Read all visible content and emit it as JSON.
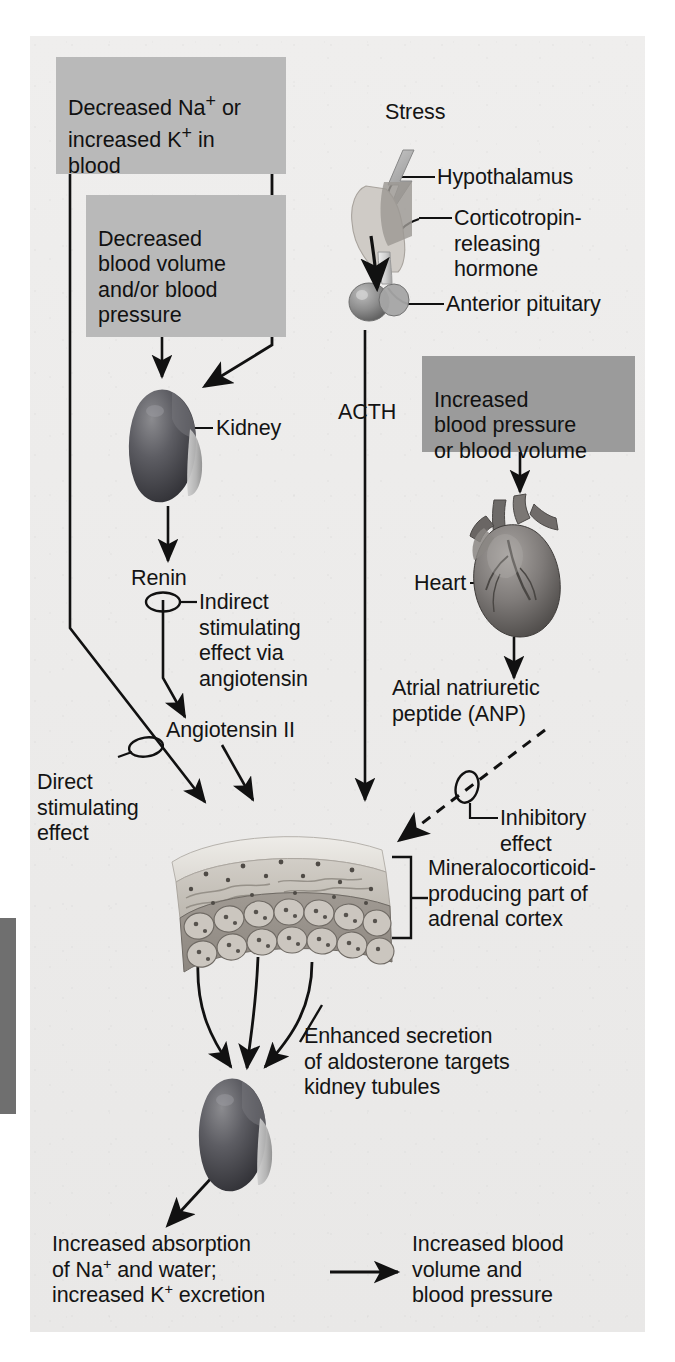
{
  "figure": {
    "type": "physiology-flow-diagram",
    "plate_color": "#edeceb",
    "box_color_light": "#b9b9b9",
    "box_color_dark": "#9b9b9b",
    "line_color": "#111111"
  },
  "boxes": [
    {
      "id": "box-sodium-potassium",
      "name": "decreased-sodium-increased-potassium-box",
      "text": "Decreased Na+ or\nincreased K+ in\nblood",
      "shade": "light"
    },
    {
      "id": "box-blood-volume",
      "name": "decreased-blood-volume-box",
      "text": "Decreased\nblood volume\nand/or blood\npressure",
      "shade": "light"
    },
    {
      "id": "box-increased-bp",
      "name": "increased-blood-pressure-box",
      "text": "Increased\nblood pressure\nor blood volume",
      "shade": "dark"
    }
  ],
  "labels": {
    "stress": "Stress",
    "hypothalamus": "Hypothalamus",
    "crh": "Corticotropin-\nreleasing\nhormone",
    "anterior_pituitary": "Anterior pituitary",
    "acth": "ACTH",
    "kidney": "Kidney",
    "renin": "Renin",
    "indirect_effect": "Indirect\nstimulating\neffect via\nangiotensin",
    "angiotensin_ii": "Angiotensin II",
    "direct_effect": "Direct\nstimulating\neffect",
    "heart": "Heart",
    "anp": "Atrial natriuretic\npeptide (ANP)",
    "inhibitory_effect": "Inhibitory\neffect",
    "adrenal_cortex": "Mineralocorticoid-\nproducing part of\nadrenal cortex",
    "enhanced_secretion": "Enhanced secretion\nof aldosterone targets\nkidney tubules",
    "increased_absorption": "Increased absorption\nof Na+ and water;\nincreased K+ excretion",
    "increased_blood_volume": "Increased blood\nvolume and\nblood pressure"
  },
  "organs": [
    {
      "name": "hypothalamus-pituitary-illustration",
      "label": "hypothalamus and pituitary"
    },
    {
      "name": "kidney-illustration-top",
      "label": "kidney"
    },
    {
      "name": "heart-illustration",
      "label": "heart"
    },
    {
      "name": "adrenal-cortex-illustration",
      "label": "adrenal cortex section"
    },
    {
      "name": "kidney-illustration-bottom",
      "label": "kidney"
    },
    {
      "name": "lightning-bolt-icon",
      "label": "stress lightning bolt"
    }
  ],
  "connectors": [
    {
      "name": "arrow-sodium-to-adrenal",
      "style": "solid",
      "meaning": "direct stimulating effect"
    },
    {
      "name": "arrow-blood-volume-to-kidney",
      "style": "solid",
      "meaning": "stimulates"
    },
    {
      "name": "arrow-kidney-to-renin",
      "style": "solid",
      "meaning": "releases"
    },
    {
      "name": "arrow-renin-to-angiotensin",
      "style": "solid",
      "meaning": "indirect stimulating effect via angiotensin"
    },
    {
      "name": "arrow-angiotensin-to-adrenal",
      "style": "solid",
      "meaning": "stimulates"
    },
    {
      "name": "arrow-pituitary-acth-to-adrenal",
      "style": "solid",
      "meaning": "ACTH stimulates"
    },
    {
      "name": "arrow-bp-to-heart",
      "style": "solid",
      "meaning": "stimulates"
    },
    {
      "name": "arrow-heart-to-anp",
      "style": "solid",
      "meaning": "secretes"
    },
    {
      "name": "arrow-anp-to-adrenal",
      "style": "dashed",
      "meaning": "inhibitory effect"
    },
    {
      "name": "arrow-adrenal-to-kidney-1",
      "style": "solid-curved",
      "meaning": "aldosterone acts on kidney"
    },
    {
      "name": "arrow-adrenal-to-kidney-2",
      "style": "solid-curved",
      "meaning": "aldosterone acts on kidney"
    },
    {
      "name": "arrow-adrenal-to-kidney-3",
      "style": "solid-curved",
      "meaning": "aldosterone acts on kidney"
    },
    {
      "name": "arrow-kidney-to-absorption",
      "style": "solid",
      "meaning": "leads to"
    },
    {
      "name": "arrow-absorption-to-blood-volume",
      "style": "solid",
      "meaning": "results in"
    }
  ]
}
